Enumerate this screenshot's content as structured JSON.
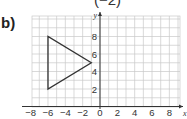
{
  "question": {
    "part_label": "b)",
    "top_fragment": "(−2)"
  },
  "chart_data": {
    "type": "scatter",
    "title": "",
    "xlabel": "x",
    "ylabel": "y",
    "xlim": [
      -8,
      9
    ],
    "ylim": [
      0,
      10
    ],
    "grid": true,
    "x_ticks": [
      -8,
      -6,
      -4,
      -2,
      0,
      2,
      4,
      6,
      8
    ],
    "x_tick_labels": [
      "−8",
      "−6",
      "−4",
      "−2",
      "0",
      "2",
      "4",
      "6",
      "8"
    ],
    "y_ticks": [
      2,
      4,
      6,
      8
    ],
    "y_tick_labels": [
      "2",
      "4",
      "6",
      "8"
    ],
    "shapes": [
      {
        "name": "triangle",
        "type": "polygon",
        "vertices": [
          [
            -6,
            8
          ],
          [
            -6,
            2
          ],
          [
            -1,
            5
          ]
        ],
        "stroke": "#333333"
      }
    ]
  },
  "colors": {
    "grid": "#c8c8c8",
    "axis": "#333333",
    "shape": "#333333"
  }
}
